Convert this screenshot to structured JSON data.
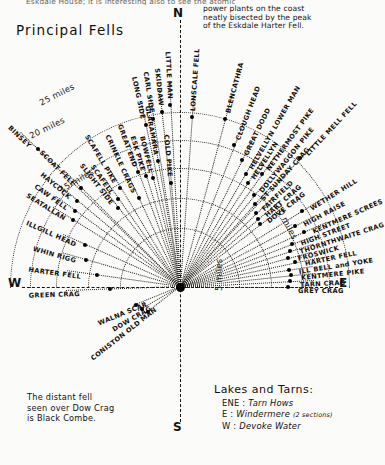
{
  "header": {
    "clipped_line": "Eskdale House; it is interesting also to see the atomic",
    "title": "Principal Fells",
    "note_lines": [
      "power plants on the coast",
      "neatly bisected by the peak",
      "of the Eskdale Harter Fell."
    ]
  },
  "compass": {
    "north": "N",
    "south": "S",
    "east": "E",
    "west": "W"
  },
  "distance_arcs": [
    {
      "label": "5 miles",
      "miles": 5
    },
    {
      "label": "10 miles",
      "miles": 10
    },
    {
      "label": "15 miles",
      "miles": 15
    },
    {
      "label": "20 miles",
      "miles": 20
    },
    {
      "label": "25 miles",
      "miles": 25
    }
  ],
  "chart_data": {
    "type": "scatter",
    "title": "Principal Fells",
    "xlabel": "Bearing (compass)",
    "ylabel": "Distance (miles)",
    "grid": true,
    "legend": "none",
    "radial_axis_ticks": [
      5,
      10,
      15,
      20,
      25
    ],
    "angular_axis_ticks": [
      "W",
      "N",
      "E",
      "S"
    ],
    "points": [
      {
        "name": "BINSEY",
        "bearing_deg": -45,
        "distance_miles": 23
      },
      {
        "name": "LONG SIDE",
        "bearing_deg": -12,
        "distance_miles": 17
      },
      {
        "name": "CARL SIDE",
        "bearing_deg": -10,
        "distance_miles": 17
      },
      {
        "name": "SKIDDAW",
        "bearing_deg": -8,
        "distance_miles": 18
      },
      {
        "name": "LITTLE MAN",
        "bearing_deg": -6,
        "distance_miles": 17
      },
      {
        "name": "LONSCALE FELL",
        "bearing_deg": 2,
        "distance_miles": 17
      },
      {
        "name": "BLENCATHRA",
        "bearing_deg": 13,
        "distance_miles": 18
      },
      {
        "name": "CLOUGH HEAD",
        "bearing_deg": 18,
        "distance_miles": 16
      },
      {
        "name": "GREAT DODD",
        "bearing_deg": 23,
        "distance_miles": 15
      },
      {
        "name": "HELVELLYN LOWER MAN",
        "bearing_deg": 27,
        "distance_miles": 13
      },
      {
        "name": "HELVELLYN",
        "bearing_deg": 29,
        "distance_miles": 13
      },
      {
        "name": "NETHERMOST PIKE",
        "bearing_deg": 32,
        "distance_miles": 12
      },
      {
        "name": "LITTLE MELL FELL",
        "bearing_deg": 38,
        "distance_miles": 20
      },
      {
        "name": "DOLLYWAGGON PIKE",
        "bearing_deg": 35,
        "distance_miles": 12
      },
      {
        "name": "ST SUNDAY CRAG",
        "bearing_deg": 39,
        "distance_miles": 13
      },
      {
        "name": "FAIRFIELD",
        "bearing_deg": 42,
        "distance_miles": 11
      },
      {
        "name": "HART CRAG",
        "bearing_deg": 45,
        "distance_miles": 11
      },
      {
        "name": "DOVE CRAG",
        "bearing_deg": 48,
        "distance_miles": 11
      },
      {
        "name": "WETHER HILL",
        "bearing_deg": 55,
        "distance_miles": 18
      },
      {
        "name": "HIGH RAISE",
        "bearing_deg": 58,
        "distance_miles": 16
      },
      {
        "name": "HIGH STREET",
        "bearing_deg": 61,
        "distance_miles": 14
      },
      {
        "name": "KENTMERE SCREES",
        "bearing_deg": 64,
        "distance_miles": 15
      },
      {
        "name": "THORNTHWAITE CRAG",
        "bearing_deg": 63,
        "distance_miles": 13
      },
      {
        "name": "FROSWICK",
        "bearing_deg": 66,
        "distance_miles": 13
      },
      {
        "name": "HARTER FELL",
        "bearing_deg": 69,
        "distance_miles": 14
      },
      {
        "name": "ILL BELL and YOKE",
        "bearing_deg": 71,
        "distance_miles": 12
      },
      {
        "name": "KENTMERE PIKE",
        "bearing_deg": 74,
        "distance_miles": 13
      },
      {
        "name": "TARN CRAG",
        "bearing_deg": 77,
        "distance_miles": 13
      },
      {
        "name": "GREY CRAG",
        "bearing_deg": 80,
        "distance_miles": 13
      },
      {
        "name": "CRINKLE CRAGS",
        "bearing_deg": -22,
        "distance_miles": 8
      },
      {
        "name": "GREAT END",
        "bearing_deg": -17,
        "distance_miles": 11
      },
      {
        "name": "ESK PIKE",
        "bearing_deg": -15,
        "distance_miles": 10
      },
      {
        "name": "BOWFELL",
        "bearing_deg": -13,
        "distance_miles": 9
      },
      {
        "name": "GLARAMARA",
        "bearing_deg": -9,
        "distance_miles": 12
      },
      {
        "name": "COLD PIKE",
        "bearing_deg": -4,
        "distance_miles": 8
      },
      {
        "name": "SCAFELL PIKE",
        "bearing_deg": -28,
        "distance_miles": 10
      },
      {
        "name": "SCAFELL",
        "bearing_deg": -33,
        "distance_miles": 9
      },
      {
        "name": "SLIGHT SIDE",
        "bearing_deg": -35,
        "distance_miles": 8
      },
      {
        "name": "SCOAT FELL",
        "bearing_deg": -42,
        "distance_miles": 14
      },
      {
        "name": "HAYCOCK",
        "bearing_deg": -47,
        "distance_miles": 13
      },
      {
        "name": "CAW FELL",
        "bearing_deg": -50,
        "distance_miles": 13
      },
      {
        "name": "SEATALLAN",
        "bearing_deg": -53,
        "distance_miles": 12
      },
      {
        "name": "ILLGILL HEAD",
        "bearing_deg": -62,
        "distance_miles": 9
      },
      {
        "name": "WHIN RIGG",
        "bearing_deg": -70,
        "distance_miles": 9
      },
      {
        "name": "HARTER FELL (ESK)",
        "bearing_deg": -78,
        "distance_miles": 7
      },
      {
        "name": "GREEN CRAG",
        "bearing_deg": -88,
        "distance_miles": 5
      },
      {
        "name": "WALNA SCAR",
        "bearing_deg": -108,
        "distance_miles": 4
      },
      {
        "name": "DOW CRAG",
        "bearing_deg": -115,
        "distance_miles": 4
      },
      {
        "name": "CONISTON OLD MAN",
        "bearing_deg": -122,
        "distance_miles": 4
      },
      {
        "name": "BLACK SAIL",
        "bearing_deg": -2,
        "distance_miles": 13
      },
      {
        "name": "NETHERMOST",
        "bearing_deg": 6,
        "distance_miles": 13
      }
    ]
  },
  "peaks": [
    {
      "name": "BINSEY",
      "angle": -46,
      "dot": 198,
      "label": 208
    },
    {
      "name": "LONG SIDE",
      "angle": -12,
      "dot": 166,
      "label": 176
    },
    {
      "name": "CARL SIDE",
      "angle": -9,
      "dot": 170,
      "label": 180
    },
    {
      "name": "SKIDDAW",
      "angle": -6,
      "dot": 176,
      "label": 186
    },
    {
      "name": "LITTLE MAN",
      "angle": -3,
      "dot": 182,
      "label": 192
    },
    {
      "name": "LONSCALE FELL",
      "angle": 4,
      "dot": 170,
      "label": 180
    },
    {
      "name": "BLENCATHRA",
      "angle": 15,
      "dot": 174,
      "label": 184
    },
    {
      "name": "CLOUGH HEAD",
      "angle": 21,
      "dot": 152,
      "label": 162
    },
    {
      "name": "GREAT DODD",
      "angle": 26,
      "dot": 141,
      "label": 151
    },
    {
      "name": "HELVELLYN LOWER MAN",
      "angle": 30,
      "dot": 131,
      "label": 141
    },
    {
      "name": "HELVELLYN",
      "angle": 33,
      "dot": 124,
      "label": 134
    },
    {
      "name": "NETHERMOST PIKE",
      "angle": 36,
      "dot": 140,
      "label": 150
    },
    {
      "name": "LITTLE MELL FELL",
      "angle": 43,
      "dot": 176,
      "label": 186
    },
    {
      "name": "DOLLYWAGGON PIKE",
      "angle": 39,
      "dot": 118,
      "label": 128
    },
    {
      "name": "ST SUNDAY CRAG",
      "angle": 42,
      "dot": 112,
      "label": 122
    },
    {
      "name": "FAIRFIELD",
      "angle": 46,
      "dot": 106,
      "label": 116
    },
    {
      "name": "HART CRAG",
      "angle": 49,
      "dot": 104,
      "label": 114
    },
    {
      "name": "DOVE CRAG",
      "angle": 52,
      "dot": 102,
      "label": 112
    },
    {
      "name": "WETHER HILL",
      "angle": 58,
      "dot": 144,
      "label": 154
    },
    {
      "name": "HIGH RAISE",
      "angle": 62,
      "dot": 130,
      "label": 140
    },
    {
      "name": "KENTMERE SCREES",
      "angle": 66,
      "dot": 136,
      "label": 146
    },
    {
      "name": "HIGH STREET",
      "angle": 69,
      "dot": 120,
      "label": 130
    },
    {
      "name": "THORNTHWAITE CRAG",
      "angle": 72,
      "dot": 116,
      "label": 126
    },
    {
      "name": "FROSWICK",
      "angle": 75,
      "dot": 112,
      "label": 122
    },
    {
      "name": "HARTER FELL",
      "angle": 78,
      "dot": 118,
      "label": 128
    },
    {
      "name": "ILL BELL and YOKE",
      "angle": 81,
      "dot": 110,
      "label": 120
    },
    {
      "name": "KENTMERE PIKE",
      "angle": 84,
      "dot": 112,
      "label": 122
    },
    {
      "name": "TARN CRAG",
      "angle": 87,
      "dot": 110,
      "label": 120
    },
    {
      "name": "GREY CRAG",
      "angle": 90,
      "dot": 108,
      "label": 118
    },
    {
      "name": "GLARAMARA",
      "angle": -10,
      "dot": 128,
      "label": 138
    },
    {
      "name": "COLD PIKE",
      "angle": -5,
      "dot": 104,
      "label": 114
    },
    {
      "name": "BOWFELL",
      "angle": -14,
      "dot": 112,
      "label": 122
    },
    {
      "name": "ESK PIKE",
      "angle": -17,
      "dot": 116,
      "label": 126
    },
    {
      "name": "GREAT END",
      "angle": -20,
      "dot": 122,
      "label": 132
    },
    {
      "name": "CRINKLE CRAGS",
      "angle": -25,
      "dot": 98,
      "label": 108
    },
    {
      "name": "SCAFELL PIKE",
      "angle": -31,
      "dot": 116,
      "label": 126
    },
    {
      "name": "SCAFELL",
      "angle": -35,
      "dot": 108,
      "label": 118
    },
    {
      "name": "SLIGHT SIDE",
      "angle": -38,
      "dot": 100,
      "label": 110
    },
    {
      "name": "SCOAT FELL",
      "angle": -45,
      "dot": 140,
      "label": 150
    },
    {
      "name": "HAYCOCK",
      "angle": -50,
      "dot": 134,
      "label": 144
    },
    {
      "name": "CAW FELL",
      "angle": -54,
      "dot": 130,
      "label": 140
    },
    {
      "name": "SEATALLAN",
      "angle": -58,
      "dot": 126,
      "label": 136
    },
    {
      "name": "ILLGILL HEAD",
      "angle": -66,
      "dot": 104,
      "label": 114
    },
    {
      "name": "WHIN RIGG",
      "angle": -74,
      "dot": 98,
      "label": 108
    },
    {
      "name": "HARTER FELL (ESK)",
      "angle": -82,
      "dot": 84,
      "label": 100
    },
    {
      "name": "GREEN CRAG",
      "angle": -92,
      "dot": 70,
      "label": 100
    },
    {
      "name": "WALNA SCAR",
      "angle": -112,
      "dot": 48,
      "label": 36
    },
    {
      "name": "DOW CRAG",
      "angle": -120,
      "dot": 44,
      "label": 34
    },
    {
      "name": "CONISTON OLD MAN",
      "angle": -128,
      "dot": 40,
      "label": 30
    }
  ],
  "footer": {
    "note_lines": [
      "The distant fell",
      "seen over Dow Crag",
      "is Black Combe."
    ],
    "lakes_title": "Lakes and Tarns:",
    "lakes": [
      {
        "bearing": "ENE :",
        "name": "Tarn Hows",
        "qualifier": ""
      },
      {
        "bearing": "E :",
        "name": "Windermere",
        "qualifier": "(2 sections)"
      },
      {
        "bearing": "W :",
        "name": "Devoke Water",
        "qualifier": ""
      }
    ]
  }
}
